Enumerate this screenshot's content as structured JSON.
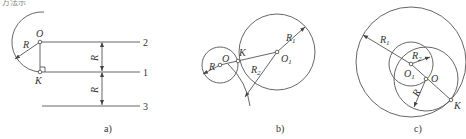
{
  "header_fragment": "方法示",
  "panels": {
    "a": {
      "caption": "a)",
      "point_labels": {
        "center": "O",
        "tangent": "K"
      },
      "radius_label": "R",
      "line_labels": [
        "2",
        "1",
        "3"
      ],
      "dimension_labels": [
        "R",
        "R"
      ]
    },
    "b": {
      "caption": "b)",
      "point_labels": {
        "small_center": "O",
        "large_center": "O",
        "large_center_sub": "1",
        "tangent": "K"
      },
      "radius_labels": {
        "small": "R",
        "r1": "R",
        "r1_sub": "1",
        "r2": "R",
        "r2_sub": "2"
      }
    },
    "c": {
      "caption": "c)",
      "point_labels": {
        "inner_center": "O",
        "inner_center_sub": "1",
        "mid_center": "O",
        "tangent": "K"
      },
      "radius_labels": {
        "r1": "R",
        "r1_sub": "1",
        "r2": "R",
        "r2_sub": "2",
        "r": "R"
      }
    }
  }
}
